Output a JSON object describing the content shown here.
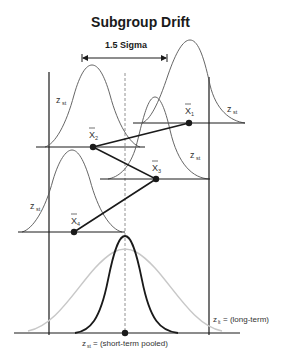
{
  "title": "Subgroup Drift",
  "shift_label": "1.5 Sigma",
  "subgroups": [
    {
      "id": "x1",
      "label": "X",
      "sub": "1",
      "dist_label": "z",
      "dist_sub": "st"
    },
    {
      "id": "x2",
      "label": "X",
      "sub": "2",
      "dist_label": "z",
      "dist_sub": "st"
    },
    {
      "id": "x3",
      "label": "X",
      "sub": "3",
      "dist_label": "z",
      "dist_sub": "st"
    },
    {
      "id": "x4",
      "label": "X",
      "sub": "4",
      "dist_label": "z",
      "dist_sub": "st"
    }
  ],
  "long_term_label": {
    "z": "z",
    "sub": "lt",
    "text": "= (long-term)"
  },
  "short_term_label": {
    "z": "z",
    "sub": "st",
    "text": "= (short-term pooled)"
  },
  "colors": {
    "line": "#1a1a1a",
    "curve": "#555555",
    "gray_curve": "#c8c8c8"
  }
}
